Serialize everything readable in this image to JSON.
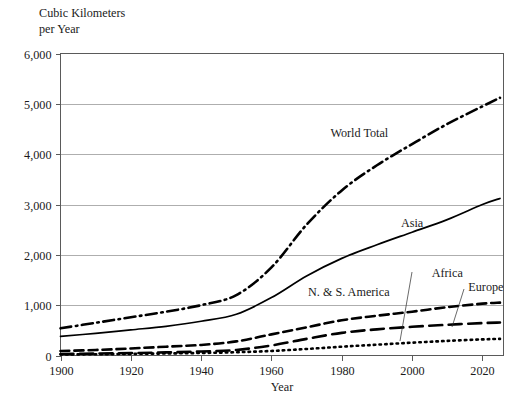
{
  "chart_data": {
    "type": "line",
    "title": "",
    "ylabel_line1": "Cubic Kilometers",
    "ylabel_line2": "per Year",
    "xlabel": "Year",
    "xlim": [
      1900,
      2026
    ],
    "ylim": [
      0,
      6000
    ],
    "grid": true,
    "legend_position": "inline-labels",
    "y_ticks": [
      "0",
      "1,000",
      "2,000",
      "3,000",
      "4,000",
      "5,000",
      "6,000"
    ],
    "y_tick_values": [
      0,
      1000,
      2000,
      3000,
      4000,
      5000,
      6000
    ],
    "x_ticks": [
      "1900",
      "1920",
      "1940",
      "1960",
      "1980",
      "2000",
      "2020"
    ],
    "x_tick_values": [
      1900,
      1920,
      1940,
      1960,
      1980,
      2000,
      2020
    ],
    "x": [
      1900,
      1910,
      1920,
      1930,
      1940,
      1950,
      1960,
      1970,
      1980,
      1990,
      2000,
      2010,
      2020,
      2025
    ],
    "series": [
      {
        "name": "World Total",
        "label": "World Total",
        "dash": "dash-dot",
        "width": 2.6,
        "values": [
          540,
          650,
          760,
          870,
          1000,
          1200,
          1750,
          2600,
          3280,
          3780,
          4200,
          4600,
          4950,
          5120
        ]
      },
      {
        "name": "Asia",
        "label": "Asia",
        "dash": "solid",
        "width": 1.7,
        "values": [
          380,
          440,
          510,
          580,
          680,
          820,
          1150,
          1580,
          1930,
          2200,
          2450,
          2700,
          3000,
          3120
        ]
      },
      {
        "name": "N. & S. America",
        "label": "N. & S. America",
        "dash": "medium-dash",
        "width": 2.6,
        "values": [
          90,
          110,
          140,
          175,
          210,
          280,
          420,
          560,
          700,
          790,
          870,
          960,
          1030,
          1050
        ]
      },
      {
        "name": "Europe",
        "label": "Europe",
        "dash": "long-dash",
        "width": 2.6,
        "values": [
          30,
          38,
          48,
          62,
          80,
          110,
          200,
          330,
          450,
          520,
          570,
          610,
          645,
          655
        ]
      },
      {
        "name": "Africa",
        "label": "Africa",
        "dash": "dotted",
        "width": 2.6,
        "values": [
          20,
          25,
          32,
          40,
          50,
          65,
          90,
          130,
          175,
          215,
          255,
          290,
          320,
          330
        ]
      }
    ],
    "annotations": [
      {
        "text": "World Total",
        "x": 1985,
        "y": 4350,
        "leader": false
      },
      {
        "text": "Asia",
        "x": 2000,
        "y": 2560,
        "leader": false
      },
      {
        "text": "N. & S. America",
        "x": 1982,
        "y": 1180,
        "leader": false
      },
      {
        "text": "Africa",
        "x": 2010,
        "y": 1560,
        "leader": true
      },
      {
        "text": "Europe",
        "x": 2021,
        "y": 1290,
        "leader": true
      }
    ]
  }
}
